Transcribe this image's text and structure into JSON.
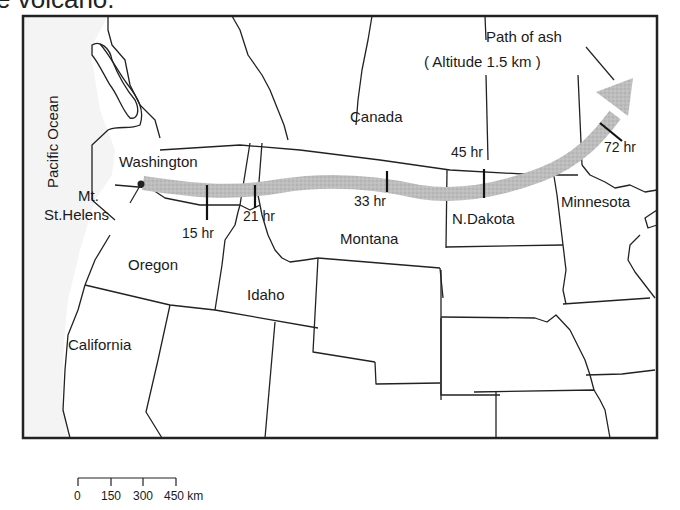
{
  "title_fragment": "e volcano.",
  "map": {
    "ocean_label": "Pacific Ocean",
    "country_label": "Canada",
    "volcano": {
      "name_line1": "Mt.",
      "name_line2": "St.Helens"
    },
    "states": {
      "washington": "Washington",
      "oregon": "Oregon",
      "idaho": "Idaho",
      "montana": "Montana",
      "north_dakota": "N.Dakota",
      "minnesota": "Minnesota",
      "california": "California"
    },
    "ash_path": {
      "label_line1": "Path of ash",
      "label_line2": "( Altitude 1.5 km )",
      "color": "#b8b8b8",
      "time_markers": [
        {
          "label": "15 hr"
        },
        {
          "label": "21 hr"
        },
        {
          "label": "33 hr"
        },
        {
          "label": "45 hr"
        },
        {
          "label": "72 hr"
        }
      ]
    },
    "scale_bar": {
      "ticks": [
        "0",
        "150",
        "300",
        "450 km"
      ]
    }
  }
}
